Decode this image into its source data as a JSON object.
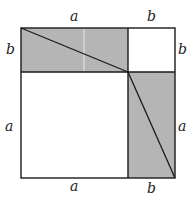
{
  "diagram": {
    "colors": {
      "shade": "#b5b5b5",
      "line": "#1a1a1a",
      "background": "#ffffff"
    },
    "labels": {
      "top_a": "a",
      "top_b": "b",
      "left_b": "b",
      "left_a": "a",
      "right_b": "b",
      "right_a": "a",
      "bottom_a": "a",
      "bottom_b": "b"
    },
    "regions": [
      {
        "name": "top-left-rectangle",
        "size": "a × b",
        "shaded": true
      },
      {
        "name": "top-right-square",
        "size": "b × b",
        "shaded": false
      },
      {
        "name": "bottom-left-square",
        "size": "a × a",
        "shaded": false
      },
      {
        "name": "bottom-right-rectangle",
        "size": "b × a",
        "shaded": true
      }
    ]
  }
}
